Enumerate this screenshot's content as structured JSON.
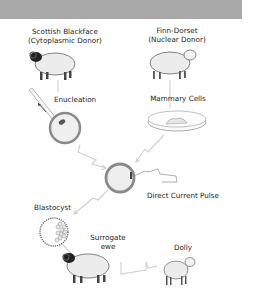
{
  "diagram": {
    "header_band_color": "#a9a9a9",
    "nodes": {
      "cytoplasmic_donor": {
        "line1": "Scottish Blackface",
        "line2": "(Cytoplasmic Donor)"
      },
      "nuclear_donor": {
        "line1": "Finn-Dorset",
        "line2": "(Nuclear Donor)"
      },
      "enucleation": {
        "label": "Enucleation"
      },
      "mammary_cells": {
        "label": "Mammary Cells"
      },
      "fusion": {
        "label": "Direct Current Pulse"
      },
      "blastocyst": {
        "label": "Blastocyst"
      },
      "surrogate": {
        "line1": "Surrogate",
        "line2": "ewe"
      },
      "dolly": {
        "label": "Dolly"
      }
    },
    "edges": [
      {
        "from": "cytoplasmic_donor",
        "to": "enucleation"
      },
      {
        "from": "nuclear_donor",
        "to": "mammary_cells"
      },
      {
        "from": "enucleation",
        "to": "fusion"
      },
      {
        "from": "mammary_cells",
        "to": "fusion"
      },
      {
        "from": "fusion",
        "to": "blastocyst"
      },
      {
        "from": "blastocyst",
        "to": "surrogate"
      },
      {
        "from": "surrogate",
        "to": "dolly"
      }
    ],
    "colors": {
      "arrow": "#c8c8c8",
      "sheep_body": "#ececec",
      "sheep_outline": "#555555",
      "blackface_head": "#222222",
      "egg_ring": "#8a8a8a",
      "egg_fill": "#efefef"
    }
  }
}
